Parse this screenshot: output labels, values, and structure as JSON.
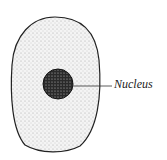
{
  "diagram": {
    "labels": [
      {
        "text": "Nucleus",
        "points_to": "nucleus"
      }
    ],
    "colors": {
      "outline": "#222222",
      "cytoplasm_stipple": "#888888",
      "nucleus": "#333333"
    }
  }
}
